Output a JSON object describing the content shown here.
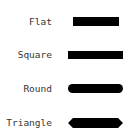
{
  "legend": {
    "items": [
      {
        "label": "Flat",
        "cap_style": "flat",
        "color": "#000000"
      },
      {
        "label": "Square",
        "cap_style": "square",
        "color": "#000000"
      },
      {
        "label": "Round",
        "cap_style": "round",
        "color": "#000000"
      },
      {
        "label": "Triangle",
        "cap_style": "triangle",
        "color": "#000000"
      }
    ]
  }
}
